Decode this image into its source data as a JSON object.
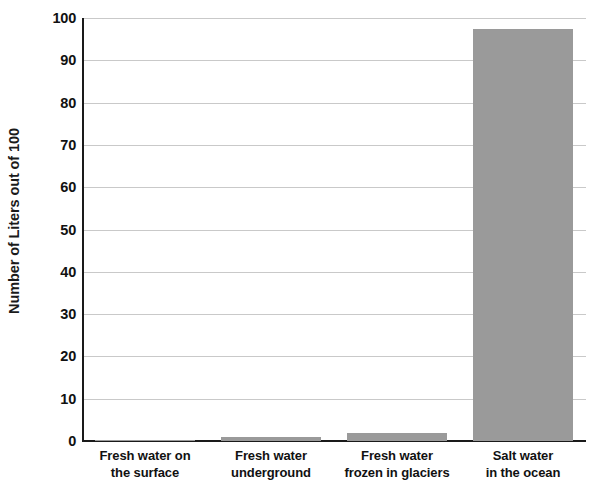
{
  "chart_data": {
    "type": "bar",
    "title": "",
    "xlabel": "",
    "ylabel": "Number of Liters out of 100",
    "ylim": [
      0,
      100
    ],
    "grid": true,
    "legend": "none",
    "bar_color": "#9a9a9a",
    "axis_color": "#1a1a1a",
    "gridline_color": "#c9c9c9",
    "categories": [
      "Fresh water on the surface",
      "Fresh water underground",
      "Fresh water frozen in glaciers",
      "Salt water in the ocean"
    ],
    "category_lines": [
      [
        "Fresh water on",
        "the surface"
      ],
      [
        "Fresh water",
        "underground"
      ],
      [
        "Fresh water",
        "frozen in glaciers"
      ],
      [
        "Salt water",
        "in the ocean"
      ]
    ],
    "values": [
      0.2,
      1.0,
      2.0,
      97.5
    ],
    "ticks": [
      100,
      90,
      80,
      70,
      60,
      50,
      40,
      30,
      20,
      10,
      0
    ],
    "tick_labels": [
      "100",
      "90",
      "80",
      "70",
      "60",
      "50",
      "40",
      "30",
      "20",
      "10",
      "0"
    ]
  }
}
